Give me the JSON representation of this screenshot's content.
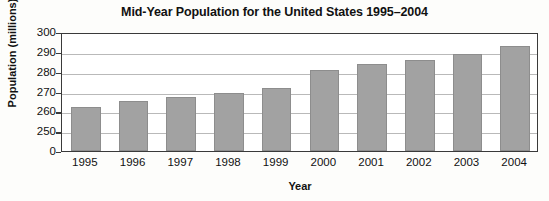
{
  "chart_data": {
    "type": "bar",
    "title": "Mid-Year Population for the United States 1995–2004",
    "xlabel": "Year",
    "ylabel": "Population (millions)",
    "categories": [
      "1995",
      "1996",
      "1997",
      "1998",
      "1999",
      "2000",
      "2001",
      "2002",
      "2003",
      "2004"
    ],
    "values": [
      262,
      265,
      267,
      269,
      272,
      281,
      284,
      286,
      289,
      293
    ],
    "ytick_labels": [
      "0",
      "250",
      "260",
      "270",
      "280",
      "290",
      "300"
    ],
    "ytick_values": [
      0,
      250,
      260,
      270,
      280,
      290,
      300
    ],
    "ylim": [
      250,
      300
    ],
    "axis_broken": true,
    "grid": true,
    "legend": null,
    "bar_color": "#a2a2a2",
    "bar_edge_color": "#8d8d8d",
    "axis_color": "#3a3a3a",
    "grid_color": "#b9b9b9",
    "background_color": "#ffffff"
  }
}
